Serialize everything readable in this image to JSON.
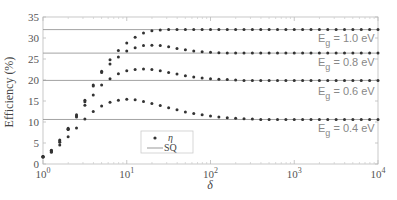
{
  "chart_data": {
    "type": "scatter",
    "title": "",
    "xlabel": "δ",
    "ylabel": "Efficiency (%)",
    "xscale": "log",
    "xlim": [
      1,
      10000
    ],
    "ylim": [
      0,
      35
    ],
    "x_ticks": [
      "10^0",
      "10^1",
      "10^2",
      "10^3",
      "10^4"
    ],
    "y_ticks": [
      0,
      5,
      10,
      15,
      20,
      25,
      30,
      35
    ],
    "grid": false,
    "legend": {
      "position": "inside-lower-middle",
      "entries": [
        "η",
        "SQ"
      ]
    },
    "x_log10_start": 0,
    "x_log10_step": 0.1,
    "series": [
      {
        "name": "η (Eg = 1.0 eV)",
        "label": "Eg = 1.0 eV",
        "sq": 32.0,
        "values": [
          1.8,
          3.3,
          5.7,
          8.5,
          11.7,
          15.2,
          18.8,
          22.1,
          24.8,
          27.0,
          28.8,
          30.2,
          31.2,
          31.7,
          31.9,
          32.0
        ]
      },
      {
        "name": "η (Eg = 0.8 eV)",
        "label": "Eg = 0.8 eV",
        "sq": 26.4,
        "values": [
          1.8,
          3.2,
          5.5,
          8.3,
          11.4,
          14.8,
          18.6,
          21.8,
          23.8,
          25.5,
          26.9,
          27.7,
          28.2,
          28.3,
          28.2,
          27.9,
          27.5,
          27.2,
          26.9,
          26.7,
          26.6,
          26.5,
          26.4
        ]
      },
      {
        "name": "η (Eg = 0.6 eV)",
        "label": "Eg = 0.6 eV",
        "sq": 19.9,
        "values": [
          1.8,
          3.0,
          5.2,
          8.2,
          11.2,
          14.0,
          16.4,
          18.8,
          20.3,
          21.5,
          22.2,
          22.5,
          22.6,
          22.5,
          22.2,
          21.8,
          21.4,
          21.0,
          20.7,
          20.5,
          20.3,
          20.2,
          20.1,
          20.0,
          19.9
        ]
      },
      {
        "name": "η (Eg = 0.4 eV)",
        "label": "Eg = 0.4 eV",
        "sq": 10.6,
        "values": [
          1.6,
          2.8,
          4.5,
          6.5,
          8.6,
          10.7,
          12.5,
          13.8,
          14.7,
          15.2,
          15.4,
          15.3,
          14.9,
          14.4,
          13.9,
          13.4,
          12.9,
          12.4,
          12.0,
          11.7,
          11.4,
          11.2,
          11.0,
          10.9,
          10.8,
          10.7,
          10.6
        ]
      }
    ],
    "annotations": [
      "Eg = 1.0 eV",
      "Eg = 0.8 eV",
      "Eg = 0.6 eV",
      "Eg = 0.4 eV"
    ]
  },
  "colors": {
    "marker": "#333333",
    "sq_line": "#999999",
    "axis": "#bbbbbb"
  }
}
